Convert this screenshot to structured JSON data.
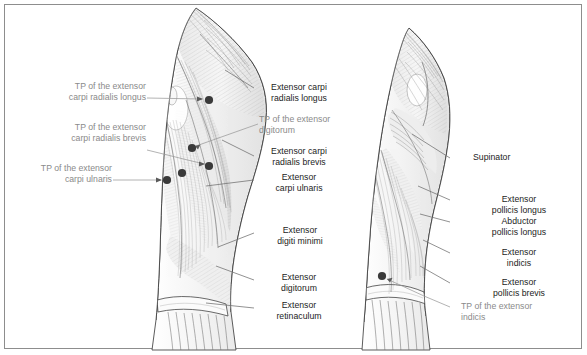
{
  "figure": {
    "border_color": "#8d8d8d",
    "background_color": "#ffffff",
    "label_color": "#1c1c1c",
    "tp_label_color": "#8a8a8a",
    "leader_color": "#6e6e6e",
    "tp_leader_color": "#9a9a9a",
    "trigger_point_color": "#3a3a3a",
    "panels": [
      {
        "name": "left-forearm-superficial-view"
      },
      {
        "name": "right-forearm-deep-view"
      }
    ]
  },
  "labels": {
    "left_column": [
      {
        "id": "tp-ecrl",
        "text": "TP of the extensor\ncarpi radialis longus",
        "type": "trigger-point"
      },
      {
        "id": "tp-ecrb",
        "text": "TP of the extensor\ncarpi radialis brevis",
        "type": "trigger-point"
      },
      {
        "id": "tp-ecu",
        "text": "TP of the extensor\ncarpi ulnaris",
        "type": "trigger-point"
      }
    ],
    "middle_column": [
      {
        "id": "ecrl",
        "text": "Extensor carpi\nradialis longus",
        "type": "muscle"
      },
      {
        "id": "tp-ed",
        "text": "TP of the extensor\ndigitorum",
        "type": "trigger-point"
      },
      {
        "id": "ecrb",
        "text": "Extensor carpi\nradialis brevis",
        "type": "muscle"
      },
      {
        "id": "ecu",
        "text": "Extensor\ncarpi ulnaris",
        "type": "muscle"
      },
      {
        "id": "edm",
        "text": "Extensor\ndigiti minimi",
        "type": "muscle"
      },
      {
        "id": "ed",
        "text": "Extensor\ndigitorum",
        "type": "muscle"
      },
      {
        "id": "er",
        "text": "Extensor\nretinaculum",
        "type": "muscle"
      }
    ],
    "right_column": [
      {
        "id": "supinator",
        "text": "Supinator",
        "type": "muscle"
      },
      {
        "id": "epl",
        "text": "Extensor\npollicis longus",
        "type": "muscle"
      },
      {
        "id": "apl",
        "text": "Abductor\npollicis longus",
        "type": "muscle"
      },
      {
        "id": "ei",
        "text": "Extensor\nindicis",
        "type": "muscle"
      },
      {
        "id": "epb",
        "text": "Extensor\npollicis brevis",
        "type": "muscle"
      },
      {
        "id": "tp-ei",
        "text": "TP of the extensor\nindicis",
        "type": "trigger-point"
      }
    ]
  },
  "trigger_points": {
    "left_figure": [
      {
        "id": "tp-dot-ecrl",
        "x": 209,
        "y": 100
      },
      {
        "id": "tp-dot-ed",
        "x": 192,
        "y": 148
      },
      {
        "id": "tp-dot-ecrb",
        "x": 209,
        "y": 166
      },
      {
        "id": "tp-dot-ecu-a",
        "x": 182,
        "y": 173
      },
      {
        "id": "tp-dot-ecu-b",
        "x": 167,
        "y": 180
      }
    ],
    "right_figure": [
      {
        "id": "tp-dot-ei",
        "x": 382,
        "y": 276
      }
    ]
  }
}
